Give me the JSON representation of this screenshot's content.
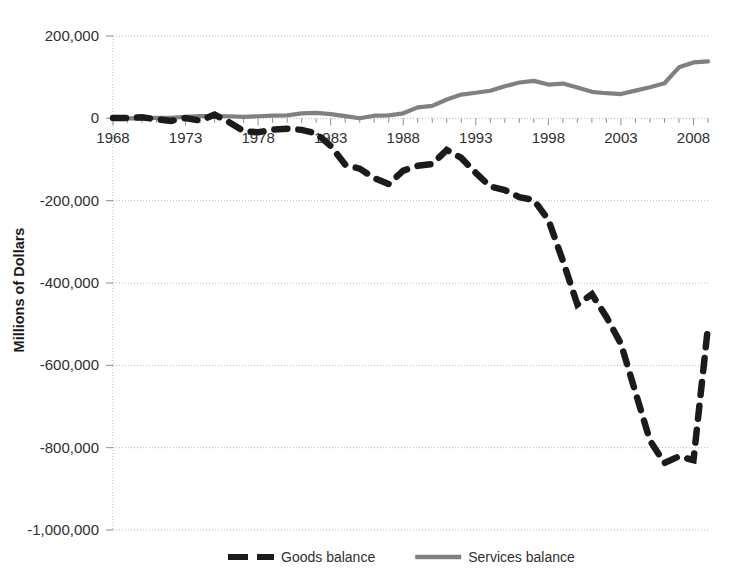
{
  "chart_data": {
    "type": "line",
    "title": "",
    "subtitle": "",
    "xlabel": "",
    "ylabel": "Millions of Dollars",
    "xlim": [
      1968,
      2009
    ],
    "ylim": [
      -1000000,
      200000
    ],
    "grid": true,
    "legend_position": "bottom",
    "y_ticks": [
      200000,
      0,
      -200000,
      -400000,
      -600000,
      -800000,
      -1000000
    ],
    "y_tick_labels": [
      "200,000",
      "0",
      "-200,000",
      "-400,000",
      "-600,000",
      "-800,000",
      "-1,000,000"
    ],
    "x_ticks": [
      1968,
      1973,
      1978,
      1983,
      1988,
      1993,
      1998,
      2003,
      2008
    ],
    "x_tick_labels": [
      "1968",
      "1973",
      "1978",
      "1983",
      "1988",
      "1993",
      "1998",
      "2003",
      "2008"
    ],
    "x_minor_tick_interval": 1,
    "x": [
      1968,
      1969,
      1970,
      1971,
      1972,
      1973,
      1974,
      1975,
      1976,
      1977,
      1978,
      1979,
      1980,
      1981,
      1982,
      1983,
      1984,
      1985,
      1986,
      1987,
      1988,
      1989,
      1990,
      1991,
      1992,
      1993,
      1994,
      1995,
      1996,
      1997,
      1998,
      1999,
      2000,
      2001,
      2002,
      2003,
      2004,
      2005,
      2006,
      2007,
      2008,
      2009
    ],
    "series": [
      {
        "name": "Goods balance",
        "color": "#1b1b1b",
        "style": "dashed",
        "values": [
          600,
          600,
          2600,
          -2300,
          -6400,
          900,
          -5500,
          8900,
          -9500,
          -31100,
          -33900,
          -27600,
          -25500,
          -28000,
          -36500,
          -67100,
          -112500,
          -122200,
          -145100,
          -159600,
          -127000,
          -115200,
          -111000,
          -76900,
          -96100,
          -132600,
          -165800,
          -174200,
          -191300,
          -198400,
          -246700,
          -346000,
          -452400,
          -427200,
          -482300,
          -547600,
          -665400,
          -782700,
          -837300,
          -821200,
          -830100,
          -505800
        ]
      },
      {
        "name": "Services balance",
        "color": "#808080",
        "style": "solid",
        "values": [
          600,
          0,
          -300,
          900,
          1400,
          3500,
          5400,
          5400,
          5000,
          3700,
          5000,
          6500,
          7300,
          12000,
          13100,
          10400,
          5200,
          300,
          6400,
          7300,
          12200,
          26700,
          30200,
          45700,
          57700,
          62100,
          67000,
          77800,
          87100,
          91000,
          82100,
          84500,
          74900,
          64400,
          61000,
          59000,
          67200,
          75600,
          85300,
          124000,
          135900,
          138400
        ]
      }
    ],
    "annotations": []
  },
  "legend": {
    "items": [
      {
        "label": "Goods balance",
        "color": "#1b1b1b",
        "style": "dashed"
      },
      {
        "label": "Services balance",
        "color": "#808080",
        "style": "solid"
      }
    ]
  },
  "axis": {
    "y_title": "Millions of Dollars"
  }
}
